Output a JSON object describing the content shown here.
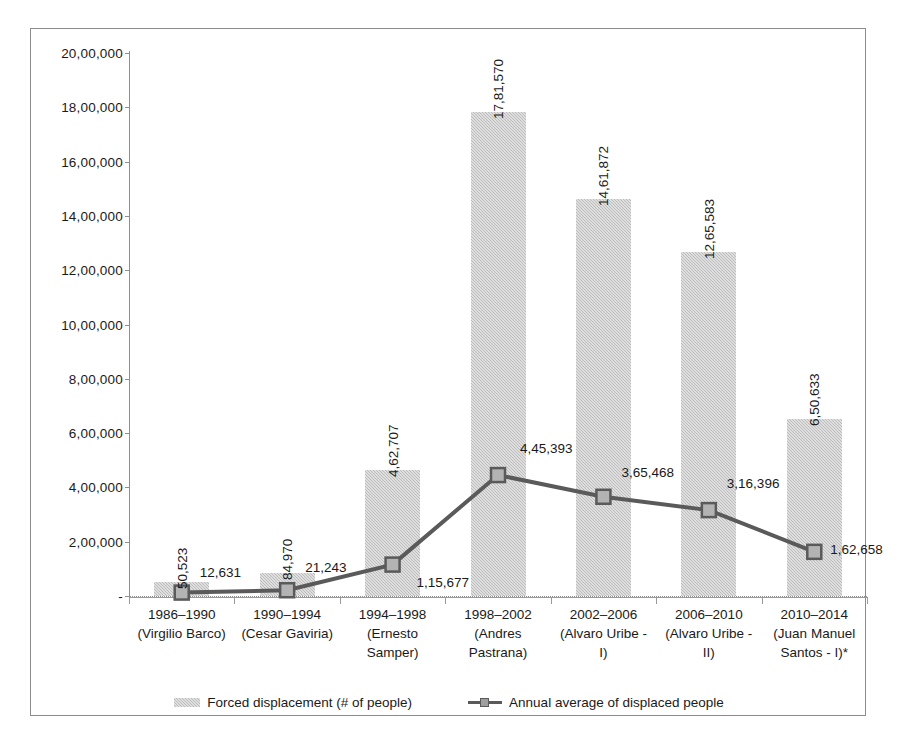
{
  "chart_data": {
    "type": "bar",
    "title": "",
    "xlabel": "",
    "ylabel": "",
    "ylim": [
      0,
      2000000
    ],
    "grid": false,
    "legend_position": "bottom",
    "categories": [
      "1986–1990 (Virgilio Barco)",
      "1990–1994 (Cesar Gaviria)",
      "1994–1998 (Ernesto Samper)",
      "1998–2002 (Andres Pastrana)",
      "2002–2006 (Alvaro Uribe - I)",
      "2006–2010 (Alvaro Uribe - II)",
      "2010–2014 (Juan Manuel Santos - I)*"
    ],
    "category_lines": [
      [
        "1986–1990",
        "(Virgilio Barco)"
      ],
      [
        "1990–1994",
        "(Cesar Gaviria)"
      ],
      [
        "1994–1998",
        "(Ernesto",
        "Samper)"
      ],
      [
        "1998–2002",
        "(Andres",
        "Pastrana)"
      ],
      [
        "2002–2006",
        "(Alvaro Uribe -",
        "I)"
      ],
      [
        "2006–2010",
        "(Alvaro Uribe -",
        "II)"
      ],
      [
        "2010–2014",
        "(Juan Manuel",
        "Santos - I)*"
      ]
    ],
    "ytick_values": [
      0,
      200000,
      400000,
      600000,
      800000,
      1000000,
      1200000,
      1400000,
      1600000,
      1800000,
      2000000
    ],
    "ytick_labels": [
      "-",
      "2,00,000",
      "4,00,000",
      "6,00,000",
      "8,00,000",
      "10,00,000",
      "12,00,000",
      "14,00,000",
      "16,00,000",
      "18,00,000",
      "20,00,000"
    ],
    "series": [
      {
        "name": "Forced displacement (# of people)",
        "type": "bar",
        "values": [
          50523,
          84970,
          462707,
          1781570,
          1461872,
          1265583,
          650633
        ],
        "labels": [
          "50,523",
          "84,970",
          "4,62,707",
          "17,81,570",
          "14,61,872",
          "12,65,583",
          "6,50,633"
        ],
        "color": "#c9c9c9"
      },
      {
        "name": "Annual average of displaced people",
        "type": "line",
        "values": [
          12631,
          21243,
          115677,
          445393,
          365468,
          316396,
          162658
        ],
        "labels": [
          "12,631",
          "21,243",
          "1,15,677",
          "4,45,393",
          "3,65,468",
          "3,16,396",
          "1,62,658"
        ],
        "color": "#5a5a5a"
      }
    ]
  },
  "legend": {
    "items": [
      {
        "label": "Forced displacement (# of people)",
        "marker": "bar-swatch"
      },
      {
        "label": "Annual average of displaced people",
        "marker": "line-square-swatch"
      }
    ]
  }
}
